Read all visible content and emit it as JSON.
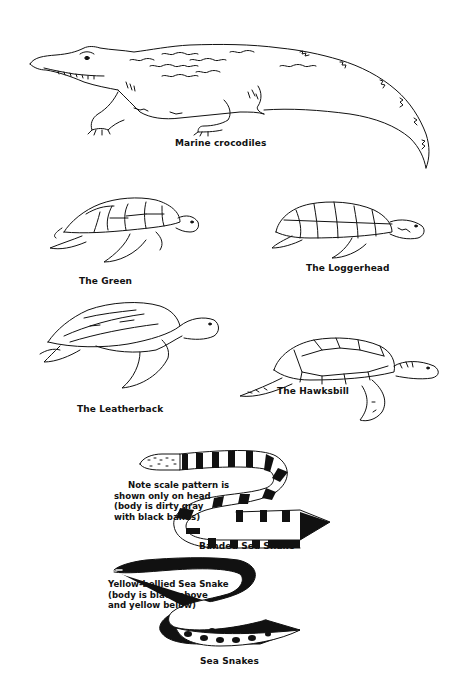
{
  "figure": {
    "background": "#ffffff",
    "ink": "#111111",
    "panels": [
      {
        "id": "crocodile",
        "caption": "Marine crocodiles"
      },
      {
        "id": "green-turtle",
        "caption": "The Green"
      },
      {
        "id": "loggerhead-turtle",
        "caption": "The Loggerhead"
      },
      {
        "id": "leatherback-turtle",
        "caption": "The Leatherback"
      },
      {
        "id": "hawksbill-turtle",
        "caption": "The Hawksbill"
      },
      {
        "id": "banded-sea-snake",
        "caption": "Banded Sea Snake",
        "note": [
          "Note scale pattern is",
          "shown only on head",
          "(body is dirty gray",
          "with black bands)"
        ]
      },
      {
        "id": "yellow-bellied-sea-snake",
        "note": [
          "Yellow-bellied Sea Snake",
          "(body is black above",
          "and yellow below)"
        ]
      },
      {
        "id": "sea-snakes-group",
        "caption": "Sea Snakes"
      }
    ]
  }
}
